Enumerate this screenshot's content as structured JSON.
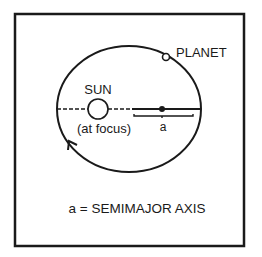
{
  "diagram": {
    "type": "orbital-ellipse",
    "labels": {
      "planet": "PLANET",
      "sun": "SUN",
      "focus_note": "(at focus)",
      "semimajor_symbol": "a",
      "caption": "a = SEMIMAJOR AXIS"
    },
    "colors": {
      "stroke": "#1a1a1a",
      "background": "#ffffff"
    },
    "geometry": {
      "frame": {
        "x": 15,
        "y": 14,
        "w": 229,
        "h": 232
      },
      "ellipse": {
        "cx": 129,
        "cy": 109,
        "rx": 72,
        "ry": 63
      },
      "sun": {
        "cx": 98,
        "cy": 109,
        "r": 10
      },
      "center_dot": {
        "cx": 162,
        "cy": 109,
        "r": 3
      },
      "planet": {
        "cx": 166,
        "cy": 57,
        "r": 3.5
      }
    }
  }
}
